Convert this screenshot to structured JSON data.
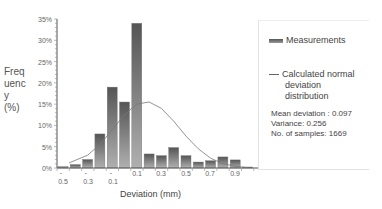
{
  "chart_data": {
    "type": "bar",
    "title": "",
    "xlabel": "Deviation (mm)",
    "ylabel": "Frequency (%)",
    "ylim": [
      0,
      35
    ],
    "yticks": [
      "0%",
      "5%",
      "10%",
      "15%",
      "20%",
      "25%",
      "30%",
      "35%"
    ],
    "xtick_labels": [
      "-0.5",
      "-0.3",
      "-0.1",
      "0.1",
      "0.3",
      "0.5",
      "0.7",
      "0.9"
    ],
    "categories": [
      "-0.6",
      "-0.5",
      "-0.4",
      "-0.3",
      "-0.2",
      "-0.1",
      "0.0",
      "0.1",
      "0.2",
      "0.3",
      "0.4",
      "0.5",
      "0.6",
      "0.7",
      "0.8",
      "0.9"
    ],
    "series": [
      {
        "name": "Measurements",
        "values": [
          0.3,
          0.8,
          2.0,
          8.0,
          19.0,
          15.5,
          34.0,
          3.3,
          2.9,
          4.8,
          2.9,
          1.4,
          1.7,
          2.6,
          1.9,
          0.2
        ]
      },
      {
        "name": "Calculated normal deviation distribution",
        "type": "line",
        "x": [
          -0.55,
          -0.4,
          -0.3,
          -0.2,
          -0.1,
          0.0,
          0.1,
          0.2,
          0.3,
          0.4,
          0.5,
          0.6,
          0.7,
          0.8,
          0.9
        ],
        "values": [
          1.2,
          3.0,
          5.5,
          9.0,
          12.5,
          15.0,
          15.5,
          14.0,
          11.0,
          7.5,
          4.5,
          2.3,
          1.0,
          0.4,
          0.1
        ]
      }
    ],
    "legend_position": "right",
    "grid": false
  },
  "chart": {
    "ylabel": "Frequency (%)",
    "xlabel": "Deviation (mm)",
    "yticks": [
      "35%",
      "30%",
      "25%",
      "20%",
      "15%",
      "10%",
      "5%",
      "0%"
    ],
    "xticks": [
      {
        "minus": "-",
        "num": "0.5"
      },
      {
        "minus": "-",
        "num": "0.3"
      },
      {
        "minus": "-",
        "num": "0.1"
      },
      {
        "minus": "",
        "num": "0.1"
      },
      {
        "minus": "",
        "num": "0.3"
      },
      {
        "minus": "",
        "num": "0.5"
      },
      {
        "minus": "",
        "num": "0.7"
      },
      {
        "minus": "",
        "num": "0.9"
      }
    ]
  },
  "legend": {
    "measurements": "Measurements",
    "curve_line1": "Calculated normal",
    "curve_line2": "deviation",
    "curve_line3": "distribution",
    "mean": "Mean deviation : 0.097",
    "variance": "Variance: 0.256",
    "samples": "No. of samples: 1669"
  },
  "colors": {
    "bar_top": "#555555",
    "bar_bottom": "#b0b0b0",
    "curve": "#777777",
    "axis": "#555555"
  }
}
